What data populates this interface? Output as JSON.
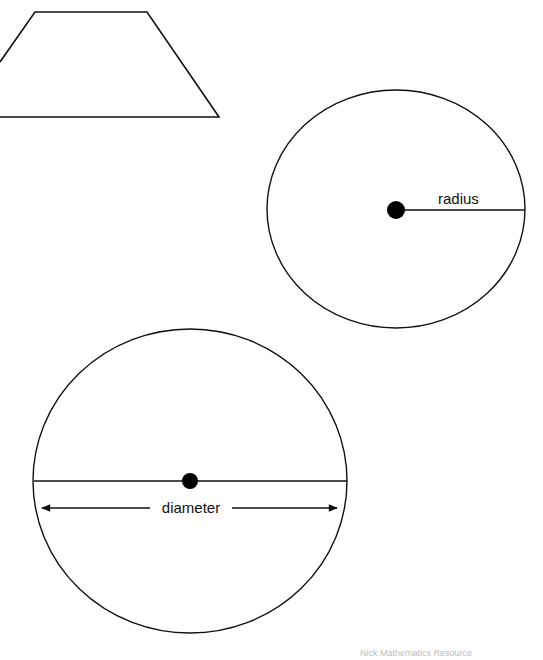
{
  "page": {
    "background": "#ffffff",
    "stroke": "#111111"
  },
  "shapes": {
    "trapezoid": {
      "name": "trapezoid"
    },
    "radius_circle": {
      "label": "radius"
    },
    "diameter_circle": {
      "label": "diameter"
    }
  },
  "footer": {
    "text": "Nick Mathematics Resource"
  }
}
